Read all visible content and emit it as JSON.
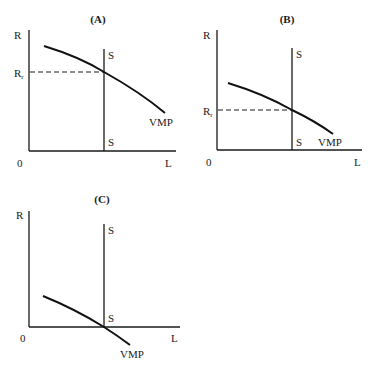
{
  "figure": {
    "panels": [
      {
        "id": "A",
        "title": "(A)",
        "y_axis_label": "R",
        "x_axis_label": "L",
        "origin_label": "0",
        "supply_top_label": "S",
        "supply_bottom_label": "S",
        "demand_label": "VMP",
        "rent_label_main": "R",
        "rent_label_sub": "r",
        "description": "Vertical supply S intersects downward-sloping VMP at a high rent level R_r"
      },
      {
        "id": "B",
        "title": "(B)",
        "y_axis_label": "R",
        "x_axis_label": "L",
        "origin_label": "0",
        "supply_top_label": "S",
        "supply_bottom_label": "S",
        "demand_label": "VMP",
        "rent_label_main": "R",
        "rent_label_sub": "r",
        "description": "Lower VMP curve intersects vertical supply at a lower rent level R_r"
      },
      {
        "id": "C",
        "title": "(C)",
        "y_axis_label": "R",
        "x_axis_label": "L",
        "origin_label": "0",
        "supply_top_label": "S",
        "supply_bottom_label": "S",
        "demand_label": "VMP",
        "description": "VMP intersects vertical supply at the horizontal axis, rent equals zero"
      }
    ]
  }
}
